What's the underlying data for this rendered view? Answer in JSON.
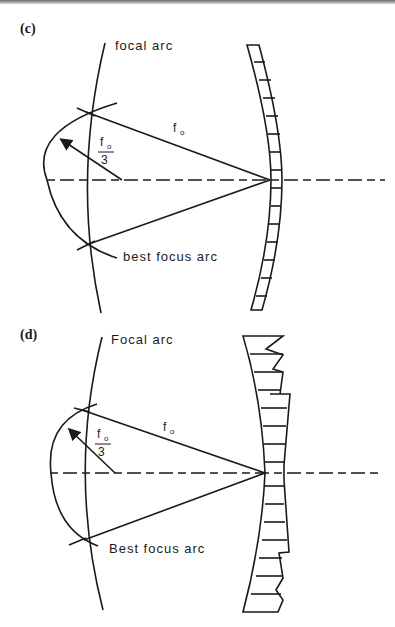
{
  "panels": [
    {
      "id": "c",
      "label": "(c)",
      "focal_arc_label": "focal arc",
      "best_focus_arc_label": "best focus arc",
      "focal_length_label": "f",
      "focal_length_sub": "o",
      "radius_label_num": "f",
      "radius_label_sub": "o",
      "radius_label_den": "3",
      "mirror_type": "curved segmented mirror"
    },
    {
      "id": "d",
      "label": "(d)",
      "focal_arc_label": "Focal arc",
      "best_focus_arc_label": "Best focus arc",
      "focal_length_label": "f",
      "focal_length_sub": "o",
      "radius_label_num": "f",
      "radius_label_sub": "o",
      "radius_label_den": "3",
      "mirror_type": "stepped segmented mirror"
    }
  ],
  "colors": {
    "line": "#1a1a1a",
    "background": "#ffffff"
  }
}
